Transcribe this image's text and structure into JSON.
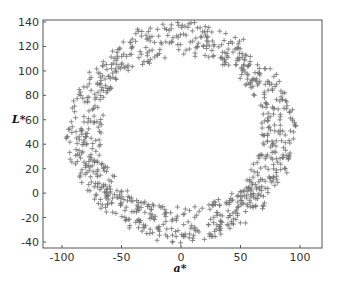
{
  "chart_data": {
    "type": "scatter",
    "title": "",
    "xlabel": "a*",
    "ylabel": "L*",
    "xlim": [
      -110,
      120
    ],
    "ylim": [
      -45,
      140
    ],
    "xticks": [
      -100,
      -50,
      0,
      50,
      100
    ],
    "yticks": [
      140,
      120,
      100,
      80,
      60,
      40,
      20,
      0,
      -20,
      -40
    ],
    "grid": false,
    "marker": "+",
    "series": [
      {
        "name": "colors",
        "description": "ring-shaped cloud of points (~900) around center (0,45)",
        "points_generated": true
      }
    ]
  }
}
